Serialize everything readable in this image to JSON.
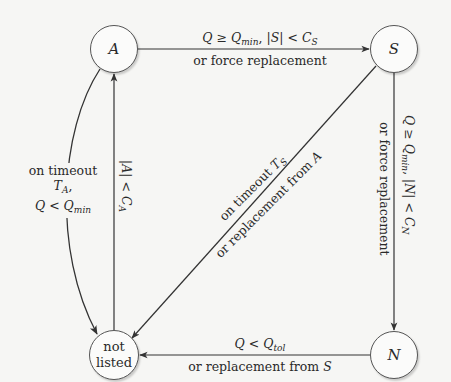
{
  "diagram": {
    "type": "state-transition",
    "nodes": [
      {
        "id": "A",
        "label": "A"
      },
      {
        "id": "S",
        "label": "S"
      },
      {
        "id": "N",
        "label": "N"
      },
      {
        "id": "not_listed",
        "label_line1": "not",
        "label_line2": "listed"
      }
    ],
    "edges": {
      "a_to_s": {
        "from": "A",
        "to": "S",
        "cond_Q": "Q",
        "cond_ge": " ≥ ",
        "cond_Qmin": "Q",
        "cond_Qmin_sub": "min",
        "cond_sep": ", |",
        "cond_S": "S",
        "cond_lt": "| < ",
        "cond_C": "C",
        "cond_C_sub": "S",
        "alt": "or force replacement"
      },
      "s_to_n": {
        "from": "S",
        "to": "N",
        "cond_Q": "Q",
        "cond_ge": " ≥ ",
        "cond_Qmin": "Q",
        "cond_Qmin_sub": "min",
        "cond_sep": ", |",
        "cond_N": "N",
        "cond_lt": "| < ",
        "cond_C": "C",
        "cond_C_sub": "N",
        "alt": "or force replacement"
      },
      "n_to_notlisted": {
        "from": "N",
        "to": "not_listed",
        "cond_Q": "Q",
        "cond_lt": " < ",
        "cond_Qtol": "Q",
        "cond_Qtol_sub": "tol",
        "alt_prefix": "or replacement from ",
        "alt_node": "S"
      },
      "notlisted_to_a": {
        "from": "not_listed",
        "to": "A",
        "cond_open": "|",
        "cond_A": "A",
        "cond_lt": "| < ",
        "cond_C": "C",
        "cond_C_sub": "A"
      },
      "a_to_notlisted": {
        "from": "A",
        "to": "not_listed",
        "line1": "on timeout",
        "line2_T": "T",
        "line2_T_sub": "A",
        "line2_comma": ",",
        "line3_Q": "Q",
        "line3_lt": " < ",
        "line3_Qmin": "Q",
        "line3_Qmin_sub": "min"
      },
      "s_to_notlisted": {
        "from": "S",
        "to": "not_listed",
        "line1_prefix": "on timeout ",
        "line1_T": "T",
        "line1_T_sub": "S",
        "line2_prefix": "or replacement from ",
        "line2_node": "A"
      }
    }
  }
}
